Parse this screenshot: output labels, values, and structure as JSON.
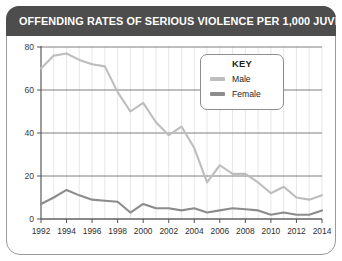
{
  "title": "OFFENDING RATES OF SERIOUS VIOLENCE PER 1,000 JUVENILES",
  "legend": {
    "heading": "KEY",
    "entries": [
      {
        "label": "Male",
        "color": "#bdbdbd"
      },
      {
        "label": "Female",
        "color": "#8c8c8c"
      }
    ]
  },
  "colors": {
    "male": "#bdbdbd",
    "female": "#8c8c8c",
    "banner": "#4d4d4d",
    "frame": "#9a9a9a",
    "gridline": "#6f6f6f",
    "minor_gridline": "#dcdcdc",
    "axis": "#555555"
  },
  "chart_data": {
    "type": "line",
    "title": "OFFENDING RATES OF SERIOUS VIOLENCE PER 1,000 JUVENILES",
    "xlabel": "",
    "ylabel": "",
    "ylim": [
      0,
      80
    ],
    "yticks": [
      0,
      20,
      40,
      60,
      80
    ],
    "ytick_labels": [
      "0",
      "20",
      "40",
      "60",
      "80"
    ],
    "xlim": [
      1992,
      2014
    ],
    "xticks": [
      1992,
      1994,
      1996,
      1998,
      2000,
      2002,
      2004,
      2006,
      2008,
      2010,
      2012,
      2014
    ],
    "xtick_labels": [
      "1992",
      "1994",
      "1996",
      "1998",
      "2000",
      "2002",
      "2004",
      "2006",
      "2008",
      "2010",
      "2012",
      "2014"
    ],
    "x": [
      1992,
      1993,
      1994,
      1995,
      1996,
      1997,
      1998,
      1999,
      2000,
      2001,
      2002,
      2003,
      2004,
      2005,
      2006,
      2007,
      2008,
      2009,
      2010,
      2011,
      2012,
      2013,
      2014
    ],
    "grid": true,
    "legend_position": "upper-right-inset",
    "series": [
      {
        "name": "Male",
        "color": "#bdbdbd",
        "values": [
          70,
          76,
          77,
          74,
          72,
          71,
          59,
          50,
          54,
          45,
          39,
          43,
          33,
          17,
          25,
          21,
          21,
          17,
          12,
          15,
          10,
          9,
          11
        ]
      },
      {
        "name": "Female",
        "color": "#8c8c8c",
        "values": [
          7,
          10,
          13.5,
          11,
          9,
          8.5,
          8,
          3,
          7,
          5,
          5,
          4,
          5,
          3,
          4,
          5,
          4.5,
          4,
          2,
          3,
          2,
          2,
          4
        ]
      }
    ]
  }
}
